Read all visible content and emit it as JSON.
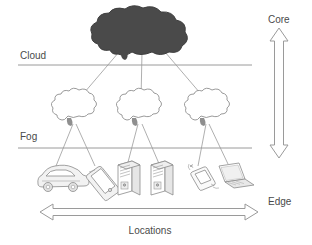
{
  "diagram": {
    "tier_labels": {
      "cloud": "Cloud",
      "fog": "Fog"
    },
    "axis_vertical": {
      "top_label": "Core",
      "bottom_label": "Edge",
      "arrow": "double-headed-vertical"
    },
    "axis_horizontal": {
      "label": "Locations",
      "arrow": "double-headed-horizontal"
    },
    "nodes": {
      "cloud_core": {
        "name": "cloud-core",
        "icon": "filled-cloud-icon",
        "fill": "#4a4a4a"
      },
      "fog_nodes": [
        {
          "name": "fog-node-left",
          "icon": "outline-cloud-icon"
        },
        {
          "name": "fog-node-center",
          "icon": "outline-cloud-icon"
        },
        {
          "name": "fog-node-right",
          "icon": "outline-cloud-icon"
        }
      ],
      "edge_devices": [
        {
          "name": "edge-device-car",
          "icon": "car-icon"
        },
        {
          "name": "edge-device-phone",
          "icon": "mobile-phone-icon"
        },
        {
          "name": "edge-device-server-1",
          "icon": "server-tower-icon"
        },
        {
          "name": "edge-device-server-2",
          "icon": "server-tower-icon"
        },
        {
          "name": "edge-device-sensor",
          "icon": "wireless-sensor-icon"
        },
        {
          "name": "edge-device-laptop",
          "icon": "laptop-icon"
        }
      ]
    },
    "colors": {
      "stroke": "#8a8a8a",
      "text": "#4a4a4a",
      "cloud_fill": "#4a4a4a",
      "device_stroke": "#8a8a8a",
      "background": "#ffffff"
    }
  }
}
